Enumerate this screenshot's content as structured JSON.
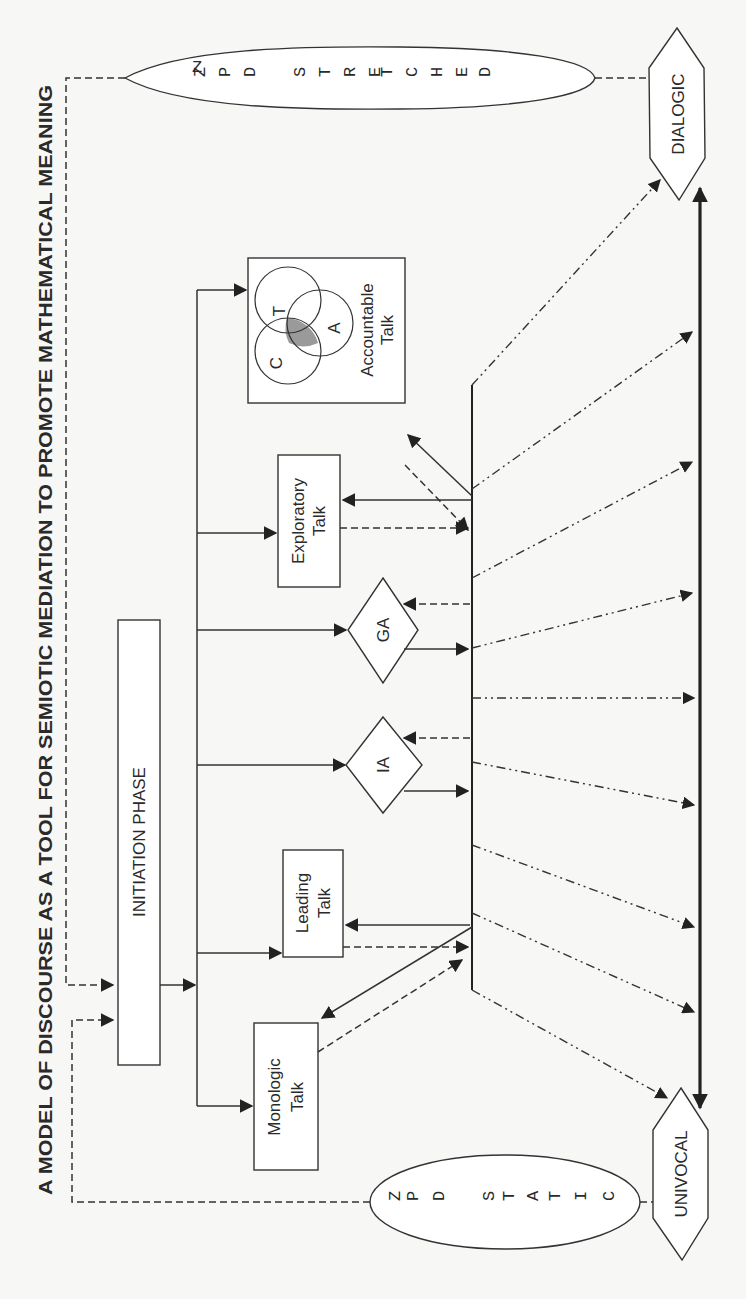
{
  "title": "A MODEL OF DISCOURSE AS A TOOL FOR SEMIOTIC MEDIATION TO PROMOTE MATHEMATICAL MEANING",
  "orientation": "rotated 90 degrees counter-clockwise",
  "zpd": {
    "stretched": {
      "label": "ZPD STRETCHED",
      "letters": [
        "Z",
        "P",
        "D",
        " ",
        "S",
        "T",
        "R",
        "E",
        "T",
        "C",
        "H",
        "E",
        "D"
      ]
    },
    "static": {
      "label": "ZPD STATIC",
      "letters": [
        "Z",
        "P",
        "D",
        " ",
        "S",
        "T",
        "A",
        "T",
        "I",
        "C"
      ]
    }
  },
  "poles": {
    "dialogic": "DIALOGIC",
    "univocal": "UNIVOCAL"
  },
  "initiation": {
    "label": "INITIATION PHASE"
  },
  "nodes": {
    "accountable": {
      "line1": "Accountable",
      "line2": "Talk",
      "venn": {
        "c": "C",
        "t": "T",
        "a": "A"
      }
    },
    "exploratory": {
      "line1": "Exploratory",
      "line2": "Talk"
    },
    "ga": {
      "label": "GA"
    },
    "ia": {
      "label": "IA"
    },
    "leading": {
      "line1": "Leading",
      "line2": "Talk"
    },
    "monologic": {
      "line1": "Monologic",
      "line2": "Talk"
    }
  },
  "colors": {
    "background": "#f7f7f5",
    "stroke": "#333333",
    "venn_intersection": "#9a9a9a"
  }
}
